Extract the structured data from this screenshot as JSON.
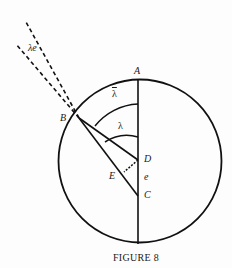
{
  "figure": {
    "caption": "FIGURE 8",
    "labels": {
      "A": "A",
      "B": "B",
      "C": "C",
      "D": "D",
      "E": "E",
      "e": "e",
      "lambda": "λ",
      "lambda_bar": "λ",
      "lambda_e": "λe"
    },
    "colors": {
      "stroke": "#111111",
      "background": "#fdfdfd"
    }
  }
}
